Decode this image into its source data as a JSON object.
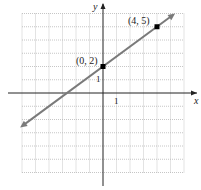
{
  "chart_data": {
    "type": "line",
    "title": "",
    "xlabel": "x",
    "ylabel": "y",
    "xlim": [
      -6,
      6
    ],
    "ylim": [
      -6,
      6
    ],
    "grid": true,
    "x_tick_label": "1",
    "y_tick_label": "1",
    "line": {
      "slope": 0.75,
      "intercept": 2,
      "equation": "y = 3/4 x + 2"
    },
    "points": [
      {
        "x": 0,
        "y": 2,
        "label": "(0, 2)"
      },
      {
        "x": 4,
        "y": 5,
        "label": "(4, 5)"
      }
    ]
  },
  "colors": {
    "line": "#7a7a7a",
    "axis": "#222222",
    "grid": "#b8b8b8",
    "point": "#000000"
  }
}
